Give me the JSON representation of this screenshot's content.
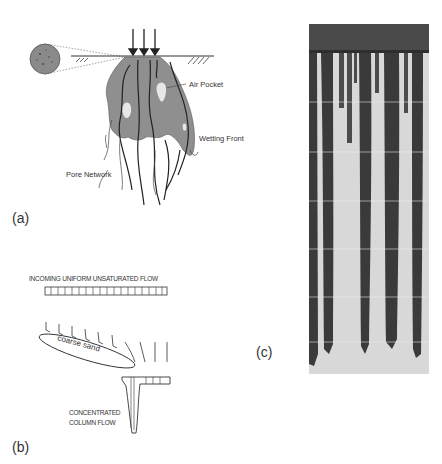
{
  "figure": {
    "panels": [
      {
        "id": "a",
        "label": "(a)",
        "annotations": {
          "air_pocket": "Air Pocket",
          "wetting_front": "Wetting Front",
          "pore_network": "Pore Network"
        }
      },
      {
        "id": "b",
        "label": "(b)",
        "annotations": {
          "incoming": "INCOMING  UNIFORM UNSATURATED FLOW",
          "coarse_sand": "coarse sand",
          "concentrated_1": "CONCENTRATED",
          "concentrated_2": "COLUMN FLOW"
        }
      },
      {
        "id": "c",
        "label": "(c)"
      }
    ],
    "colors": {
      "plume_gray": "#8f8f8f",
      "ink": "#222222",
      "photo_dark": "#3a3a3a",
      "photo_light": "#d8d8d8"
    }
  }
}
